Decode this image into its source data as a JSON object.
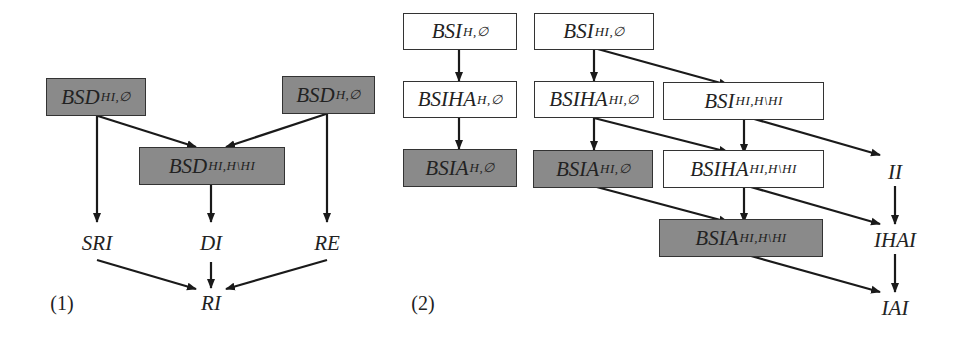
{
  "diagram1": {
    "caption": "(1)",
    "nodes": {
      "bsd_hi_empty": {
        "main": "BSD",
        "sub": "HI,∅",
        "fill": "gray"
      },
      "bsd_h_empty": {
        "main": "BSD",
        "sub": "H,∅",
        "fill": "gray"
      },
      "bsd_hi_h_minus_hi": {
        "main": "BSD",
        "sub": "HI,H\\HI",
        "fill": "gray"
      },
      "sri": {
        "label": "SRI"
      },
      "di": {
        "label": "DI"
      },
      "re": {
        "label": "RE"
      },
      "ri": {
        "label": "RI"
      }
    },
    "edges": [
      [
        "BSD_{HI,∅}",
        "BSD_{HI,H\\HI}"
      ],
      [
        "BSD_{H,∅}",
        "BSD_{HI,H\\HI}"
      ],
      [
        "BSD_{HI,∅}",
        "SRI"
      ],
      [
        "BSD_{HI,H\\HI}",
        "DI"
      ],
      [
        "BSD_{H,∅}",
        "RE"
      ],
      [
        "SRI",
        "RI"
      ],
      [
        "DI",
        "RI"
      ],
      [
        "RE",
        "RI"
      ]
    ]
  },
  "diagram2": {
    "caption": "(2)",
    "nodes": {
      "bsi_h_empty": {
        "main": "BSI",
        "sub": "H,∅",
        "fill": "white"
      },
      "bsi_hi_empty": {
        "main": "BSI",
        "sub": "HI,∅",
        "fill": "white"
      },
      "bsiha_h_empty": {
        "main": "BSIHA",
        "sub": "H,∅",
        "fill": "white"
      },
      "bsiha_hi_empty": {
        "main": "BSIHA",
        "sub": "HI,∅",
        "fill": "white"
      },
      "bsi_hi_h_minus_hi": {
        "main": "BSI",
        "sub": "HI,H\\HI",
        "fill": "white"
      },
      "bsia_h_empty": {
        "main": "BSIA",
        "sub": "H,∅",
        "fill": "gray"
      },
      "bsia_hi_empty": {
        "main": "BSIA",
        "sub": "HI,∅",
        "fill": "gray"
      },
      "bsiha_hi_h_minus_hi": {
        "main": "BSIHA",
        "sub": "HI,H\\HI",
        "fill": "white"
      },
      "bsia_hi_h_minus_hi": {
        "main": "BSIA",
        "sub": "HI,H\\HI",
        "fill": "gray"
      },
      "ii": {
        "label": "II"
      },
      "ihai": {
        "label": "IHAI"
      },
      "iai": {
        "label": "IAI"
      }
    },
    "edges": [
      [
        "BSI_{H,∅}",
        "BSIHA_{H,∅}"
      ],
      [
        "BSIHA_{H,∅}",
        "BSIA_{H,∅}"
      ],
      [
        "BSI_{HI,∅}",
        "BSIHA_{HI,∅}"
      ],
      [
        "BSI_{HI,∅}",
        "BSI_{HI,H\\HI}"
      ],
      [
        "BSIHA_{HI,∅}",
        "BSIA_{HI,∅}"
      ],
      [
        "BSIHA_{HI,∅}",
        "BSIHA_{HI,H\\HI}"
      ],
      [
        "BSI_{HI,H\\HI}",
        "BSIHA_{HI,H\\HI}"
      ],
      [
        "BSI_{HI,H\\HI}",
        "II"
      ],
      [
        "BSIA_{HI,∅}",
        "BSIA_{HI,H\\HI}"
      ],
      [
        "BSIHA_{HI,H\\HI}",
        "BSIA_{HI,H\\HI}"
      ],
      [
        "BSIHA_{HI,H\\HI}",
        "IHAI"
      ],
      [
        "II",
        "IHAI"
      ],
      [
        "IHAI",
        "IAI"
      ],
      [
        "BSIA_{HI,H\\HI}",
        "IAI"
      ]
    ]
  },
  "colors": {
    "shaded_node": "#8a8a8a",
    "plain_node": "#ffffff",
    "stroke": "#1a1a1a"
  }
}
